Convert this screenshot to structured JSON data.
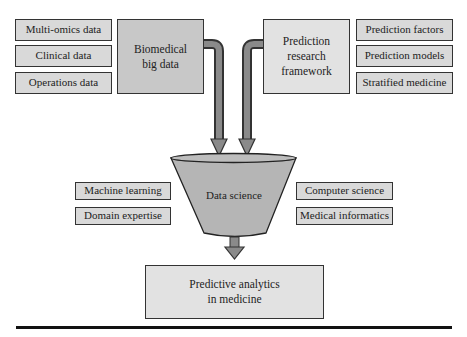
{
  "left_inputs": {
    "items": [
      {
        "label": "Multi-omics data"
      },
      {
        "label": "Clinical data"
      },
      {
        "label": "Operations data"
      }
    ]
  },
  "biomedical": {
    "label_line1": "Biomedical",
    "label_line2": "big data"
  },
  "framework": {
    "label_line1": "Prediction",
    "label_line2": "research",
    "label_line3": "framework"
  },
  "right_inputs": {
    "items": [
      {
        "label": "Prediction factors"
      },
      {
        "label": "Prediction models"
      },
      {
        "label": "Stratified medicine"
      }
    ]
  },
  "funnel": {
    "label": "Data science"
  },
  "left_disciplines": {
    "items": [
      {
        "label": "Machine learning"
      },
      {
        "label": "Domain expertise"
      }
    ]
  },
  "right_disciplines": {
    "items": [
      {
        "label": "Computer science"
      },
      {
        "label": "Medical informatics"
      }
    ]
  },
  "output": {
    "label_line1": "Predictive analytics",
    "label_line2": "in medicine"
  },
  "colors": {
    "small_box": "#d9d9d9",
    "biomedical_box": "#c8c8c8",
    "framework_box": "#e2e2e2",
    "funnel": "#b5b5b5",
    "arrow": "#888888",
    "outline": "#333333"
  }
}
